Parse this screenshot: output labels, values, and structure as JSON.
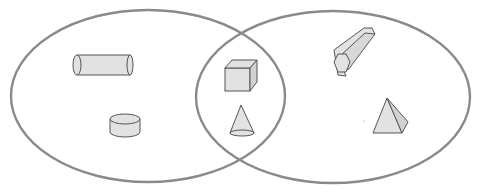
{
  "diagram": {
    "type": "venn",
    "colors": {
      "outline": "#8a8a8a",
      "shape_fill": "#e2e2e2",
      "shape_stroke": "#555555",
      "background": "#ffffff"
    },
    "sets": [
      {
        "name": "left-set",
        "shapes": [
          "cylinder-horizontal",
          "cylinder-short"
        ]
      },
      {
        "name": "right-set",
        "shapes": [
          "hexagonal-prism",
          "pyramid"
        ]
      }
    ],
    "intersection": {
      "shapes": [
        "cube",
        "cone"
      ]
    }
  }
}
